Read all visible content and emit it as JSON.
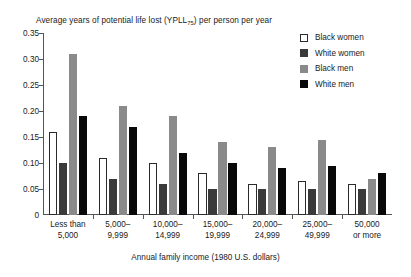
{
  "chart_data": {
    "type": "bar",
    "title": "Average years of potential life lost (YPLL75) per person per year",
    "title_main": "Average years of potential life lost (YPLL",
    "title_sub": "75",
    "title_tail": ") per person per year",
    "xlabel": "Annual family income (1980 U.S. dollars)",
    "ylabel": "",
    "ylim": [
      0,
      0.35
    ],
    "ytick_values": [
      0,
      0.05,
      0.1,
      0.15,
      0.2,
      0.25,
      0.3,
      0.35
    ],
    "ytick_labels": [
      "0",
      "0.05",
      "0.10",
      "0.15",
      "0.20",
      "0.25",
      "0.30",
      "0.35"
    ],
    "grid": false,
    "legend_position": "top-right",
    "categories": [
      "Less than 5,000",
      "5,000-9,999",
      "10,000-14,999",
      "15,000-19,999",
      "20,000-24,999",
      "25,000-49,999",
      "50,000 or more"
    ],
    "category_lines": [
      [
        "Less than",
        "5,000"
      ],
      [
        "5,000–",
        "9,999"
      ],
      [
        "10,000–",
        "14,999"
      ],
      [
        "15,000–",
        "19,999"
      ],
      [
        "20,000–",
        "24,999"
      ],
      [
        "25,000–",
        "49,999"
      ],
      [
        "50,000",
        "or more"
      ]
    ],
    "series": [
      {
        "name": "Black women",
        "color": "#ffffff",
        "edge_color": "#2b2b2b",
        "values": [
          0.16,
          0.11,
          0.1,
          0.08,
          0.06,
          0.065,
          0.06
        ]
      },
      {
        "name": "White women",
        "color": "#3a3a3a",
        "edge_color": "#3a3a3a",
        "values": [
          0.1,
          0.07,
          0.06,
          0.05,
          0.05,
          0.05,
          0.05
        ]
      },
      {
        "name": "Black men",
        "color": "#8a8a8a",
        "edge_color": "#8a8a8a",
        "values": [
          0.31,
          0.21,
          0.19,
          0.14,
          0.13,
          0.145,
          0.07
        ]
      },
      {
        "name": "White men",
        "color": "#080808",
        "edge_color": "#080808",
        "values": [
          0.19,
          0.17,
          0.12,
          0.1,
          0.09,
          0.095,
          0.08
        ]
      }
    ]
  },
  "legend": {
    "items": [
      {
        "label": "Black women",
        "swatch": "sw-bw"
      },
      {
        "label": "White women",
        "swatch": "sw-ww"
      },
      {
        "label": "Black men",
        "swatch": "sw-bm"
      },
      {
        "label": "White men",
        "swatch": "sw-wm"
      }
    ]
  }
}
